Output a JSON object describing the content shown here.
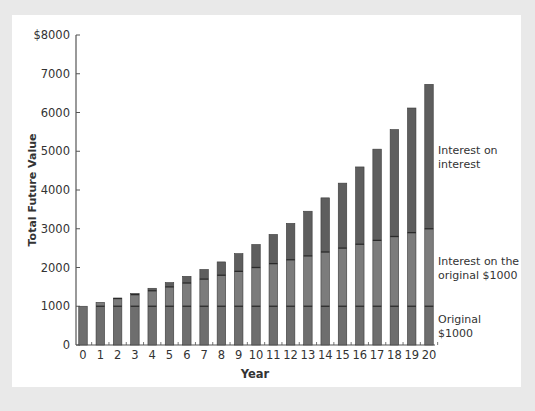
{
  "chart_data": {
    "type": "bar",
    "stacked": true,
    "title": "",
    "xlabel": "Year",
    "ylabel": "Total Future Value",
    "ylim": [
      0,
      8000
    ],
    "yticks": [
      0,
      1000,
      2000,
      3000,
      4000,
      5000,
      6000,
      7000,
      8000
    ],
    "ytick_labels": [
      "0",
      "1000",
      "2000",
      "3000",
      "4000",
      "5000",
      "6000",
      "7000",
      "$8000"
    ],
    "grid": false,
    "legend_position": "right (inline labels)",
    "categories": [
      "0",
      "1",
      "2",
      "3",
      "4",
      "5",
      "6",
      "7",
      "8",
      "9",
      "10",
      "11",
      "12",
      "13",
      "14",
      "15",
      "16",
      "17",
      "18",
      "19",
      "20"
    ],
    "series": [
      {
        "name": "Original $1000",
        "color": "#6e6e6e",
        "values": [
          1000,
          1000,
          1000,
          1000,
          1000,
          1000,
          1000,
          1000,
          1000,
          1000,
          1000,
          1000,
          1000,
          1000,
          1000,
          1000,
          1000,
          1000,
          1000,
          1000,
          1000
        ]
      },
      {
        "name": "Interest on the original $1000",
        "color": "#7c7c7c",
        "values": [
          0,
          100,
          200,
          300,
          400,
          500,
          600,
          700,
          800,
          900,
          1000,
          1100,
          1200,
          1300,
          1400,
          1500,
          1600,
          1700,
          1800,
          1900,
          2000
        ]
      },
      {
        "name": "Interest on interest",
        "color": "#5e5e5e",
        "values": [
          0,
          0,
          10,
          31,
          64,
          111,
          172,
          249,
          344,
          458,
          594,
          753,
          938,
          1152,
          1397,
          1677,
          1995,
          2354,
          2760,
          3216,
          3727
        ]
      }
    ],
    "totals": [
      1000,
      1100,
      1210,
      1331,
      1464,
      1611,
      1772,
      1949,
      2144,
      2358,
      2594,
      2853,
      3138,
      3452,
      3797,
      4177,
      4595,
      5054,
      5560,
      6116,
      6727
    ]
  },
  "legend_labels": {
    "interest_on_interest": [
      "Interest on",
      "interest"
    ],
    "interest_on_original": [
      "Interest on the",
      "original $1000"
    ],
    "original": [
      "Original",
      "$1000"
    ]
  },
  "colors": {
    "background": "#e9e9e9",
    "panel": "#ffffff",
    "separator": "#2a2a2a",
    "axis": "#555555"
  }
}
